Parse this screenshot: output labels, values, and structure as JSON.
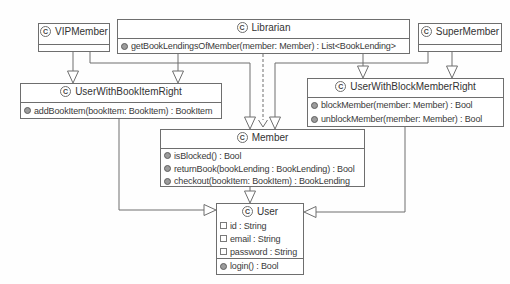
{
  "diagram": {
    "icons": {
      "class_letter": "C",
      "method_icon": "filled-circle",
      "attribute_icon": "hollow-square"
    },
    "colors": {
      "border": "#6e6e6e",
      "text": "#3a3a3a",
      "line": "#6e6e6e",
      "method_ball": "#9c9c9c",
      "background": "#ffffff"
    },
    "classes": {
      "vip_member": {
        "name": "VIPMember"
      },
      "librarian": {
        "name": "Librarian",
        "methods": [
          "getBookLendingsOfMember(member: Member) : List<BookLending>"
        ]
      },
      "super_member": {
        "name": "SuperMember"
      },
      "user_with_book_item_right": {
        "name": "UserWithBookItemRight",
        "methods": [
          "addBookItem(bookItem: BookItem) : BookItem"
        ]
      },
      "user_with_block_member_right": {
        "name": "UserWithBlockMemberRight",
        "methods": [
          "blockMember(member: Member) : Bool",
          "unblockMember(member: Member) : Bool"
        ]
      },
      "member": {
        "name": "Member",
        "methods": [
          "isBlocked() : Bool",
          "returnBook(bookLending : BookLending) : Bool",
          "checkout(bookItem: BookItem) : BookLending"
        ]
      },
      "user": {
        "name": "User",
        "attributes": [
          "id : String",
          "email : String",
          "password : String"
        ],
        "methods": [
          "login() : Bool"
        ]
      }
    },
    "relationships": [
      {
        "from": "VIPMember",
        "to": "UserWithBookItemRight",
        "type": "generalization"
      },
      {
        "from": "VIPMember",
        "to": "Member",
        "type": "generalization"
      },
      {
        "from": "Librarian",
        "to": "UserWithBookItemRight",
        "type": "generalization"
      },
      {
        "from": "Librarian",
        "to": "Member",
        "type": "dependency"
      },
      {
        "from": "Librarian",
        "to": "UserWithBlockMemberRight",
        "type": "generalization"
      },
      {
        "from": "SuperMember",
        "to": "UserWithBlockMemberRight",
        "type": "generalization"
      },
      {
        "from": "SuperMember",
        "to": "Member",
        "type": "generalization"
      },
      {
        "from": "Member",
        "to": "User",
        "type": "generalization"
      },
      {
        "from": "UserWithBookItemRight",
        "to": "User",
        "type": "generalization"
      },
      {
        "from": "UserWithBlockMemberRight",
        "to": "User",
        "type": "generalization"
      }
    ]
  }
}
